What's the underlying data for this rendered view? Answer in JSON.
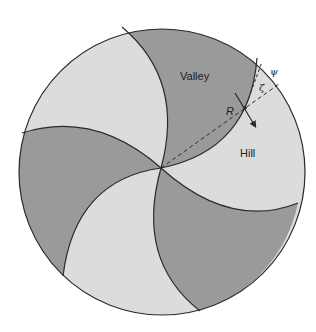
{
  "figure": {
    "type": "spiral-pinwheel-diagram",
    "colors": {
      "dark_region": "#9a9a9a",
      "light_region": "#dcdcdc",
      "outline": "#2a2a2a",
      "background": "#ffffff"
    },
    "labels": {
      "valley": "Valley",
      "hill": "Hill",
      "point": "R",
      "angle_psi": "ψ",
      "angle_zeta": "ζ"
    },
    "regions": [
      {
        "name": "valley-top",
        "shade": "dark"
      },
      {
        "name": "hill-right",
        "shade": "light"
      },
      {
        "name": "valley-bottom-right",
        "shade": "dark"
      },
      {
        "name": "hill-bottom-left",
        "shade": "light"
      },
      {
        "name": "valley-left",
        "shade": "dark"
      },
      {
        "name": "hill-upper-left",
        "shade": "light"
      }
    ]
  }
}
